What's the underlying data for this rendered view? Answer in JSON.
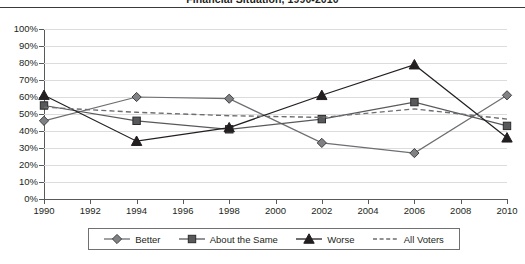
{
  "chart_data": {
    "type": "line",
    "title": "Financial Situation, 1990-2010",
    "xlabel": "",
    "ylabel": "",
    "x": [
      1990,
      1994,
      1998,
      2002,
      2006,
      2010
    ],
    "xlim": [
      1990,
      2010
    ],
    "ylim": [
      0,
      100
    ],
    "y_tick_labels": [
      "0%",
      "10%",
      "20%",
      "30%",
      "40%",
      "50%",
      "60%",
      "70%",
      "80%",
      "90%",
      "100%"
    ],
    "y_tick_values": [
      0,
      10,
      20,
      30,
      40,
      50,
      60,
      70,
      80,
      90,
      100
    ],
    "x_tick_labels": [
      "1990",
      "1992",
      "1994",
      "1996",
      "1998",
      "2000",
      "2002",
      "2004",
      "2006",
      "2008",
      "2010"
    ],
    "x_tick_values": [
      1990,
      1992,
      1994,
      1996,
      1998,
      2000,
      2002,
      2004,
      2006,
      2008,
      2010
    ],
    "grid": true,
    "legend_position": "bottom",
    "series": [
      {
        "name": "Better",
        "marker": "diamond",
        "style": "solid",
        "color": "#6d6e71",
        "values": [
          46,
          60,
          59,
          33,
          27,
          61
        ]
      },
      {
        "name": "About the Same",
        "marker": "square",
        "style": "solid",
        "color": "#58595b",
        "values": [
          55,
          46,
          41,
          47,
          57,
          43
        ]
      },
      {
        "name": "Worse",
        "marker": "triangle",
        "style": "solid",
        "color": "#231f20",
        "values": [
          61,
          34,
          42,
          61,
          79,
          36
        ]
      },
      {
        "name": "All Voters",
        "marker": "none",
        "style": "dashed",
        "color": "#6d6e71",
        "values": [
          54,
          51,
          49,
          48,
          53,
          47
        ]
      }
    ]
  },
  "legend": {
    "items": [
      {
        "label": "Better",
        "key": "diamond-marker-icon"
      },
      {
        "label": "About the Same",
        "key": "square-marker-icon"
      },
      {
        "label": "Worse",
        "key": "triangle-marker-icon"
      },
      {
        "label": "All Voters",
        "key": "dashed-line-icon"
      }
    ]
  },
  "colors": {
    "axis": "#58595b",
    "grid": "#dcdcdc",
    "title_rule": "#3a3a3a",
    "text": "#231f20",
    "legend_border": "#6f7072",
    "background": "#ffffff"
  }
}
